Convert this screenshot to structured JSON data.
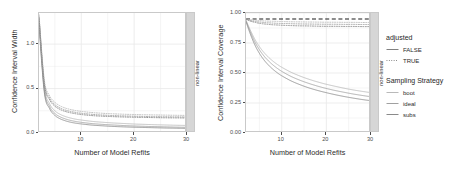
{
  "figure": {
    "background": "#ffffff",
    "panel_border_color": "#c9c9c9",
    "strip_background": "#d6d6d6",
    "grid_color": "#ebebeb"
  },
  "panels": [
    {
      "strip_label": "non-linear",
      "xlabel": "Number of Model Refits",
      "ylabel": "Confidence Interval Width",
      "x_ticks": [
        "10",
        "20",
        "30"
      ],
      "y_ticks": [
        "0.0",
        "0.5",
        "1.0"
      ]
    },
    {
      "strip_label": "non-linear",
      "xlabel": "Number of Model Refits",
      "ylabel": "Confidence Interval Coverage",
      "x_ticks": [
        "10",
        "20",
        "30"
      ],
      "y_ticks": [
        "0.00",
        "0.25",
        "0.50",
        "0.75",
        "1.00"
      ]
    }
  ],
  "legend": {
    "groups": [
      {
        "title": "adjusted",
        "items": [
          {
            "label": "FALSE",
            "linetype": "solid",
            "color": "#808080"
          },
          {
            "label": "TRUE",
            "linetype": "dotted",
            "color": "#808080"
          }
        ]
      },
      {
        "title": "Sampling Strategy",
        "items": [
          {
            "label": "boot",
            "linetype": "solid",
            "color": "#b9b9b9"
          },
          {
            "label": "ideal",
            "linetype": "solid",
            "color": "#a0a0a0"
          },
          {
            "label": "subs",
            "linetype": "solid",
            "color": "#8a8a8a"
          }
        ]
      }
    ]
  },
  "chart_data": {
    "type": "line",
    "title": "",
    "facet": "non-linear",
    "panels": [
      {
        "name": "width-panel",
        "xlabel": "Number of Model Refits",
        "ylabel": "Confidence Interval Width",
        "xlim": [
          2,
          30
        ],
        "ylim": [
          0.0,
          1.35
        ],
        "x_ticks": [
          10,
          20,
          30
        ],
        "y_ticks": [
          0.0,
          0.5,
          1.0
        ],
        "grid": true,
        "x": [
          2,
          3,
          4,
          5,
          6,
          7,
          8,
          9,
          10,
          12,
          14,
          16,
          18,
          20,
          22,
          24,
          26,
          28,
          30
        ],
        "series": [
          {
            "name": "boot, adjusted=FALSE",
            "sampling": "boot",
            "adjusted": "FALSE",
            "linetype": "solid",
            "color": "#b9b9b9",
            "values": [
              1.3,
              0.52,
              0.33,
              0.25,
              0.21,
              0.185,
              0.168,
              0.155,
              0.146,
              0.131,
              0.121,
              0.113,
              0.107,
              0.101,
              0.097,
              0.093,
              0.09,
              0.087,
              0.085
            ]
          },
          {
            "name": "ideal, adjusted=FALSE",
            "sampling": "ideal",
            "adjusted": "FALSE",
            "linetype": "solid",
            "color": "#a0a0a0",
            "values": [
              1.26,
              0.49,
              0.3,
              0.22,
              0.182,
              0.158,
              0.141,
              0.129,
              0.12,
              0.106,
              0.097,
              0.09,
              0.084,
              0.079,
              0.075,
              0.072,
              0.069,
              0.066,
              0.064
            ]
          },
          {
            "name": "subs, adjusted=FALSE",
            "sampling": "subs",
            "adjusted": "FALSE",
            "linetype": "solid",
            "color": "#8a8a8a",
            "values": [
              1.22,
              0.46,
              0.275,
              0.198,
              0.16,
              0.137,
              0.121,
              0.11,
              0.102,
              0.089,
              0.081,
              0.074,
              0.069,
              0.065,
              0.062,
              0.059,
              0.056,
              0.054,
              0.052
            ]
          },
          {
            "name": "boot, adjusted=TRUE",
            "sampling": "boot",
            "adjusted": "TRUE",
            "linetype": "dotted",
            "color": "#b9b9b9",
            "values": [
              1.33,
              0.6,
              0.42,
              0.345,
              0.305,
              0.28,
              0.264,
              0.252,
              0.243,
              0.23,
              0.222,
              0.216,
              0.211,
              0.208,
              0.205,
              0.203,
              0.201,
              0.199,
              0.198
            ]
          },
          {
            "name": "ideal, adjusted=TRUE",
            "sampling": "ideal",
            "adjusted": "TRUE",
            "linetype": "dotted",
            "color": "#a0a0a0",
            "values": [
              1.31,
              0.57,
              0.395,
              0.32,
              0.282,
              0.258,
              0.242,
              0.231,
              0.222,
              0.21,
              0.202,
              0.196,
              0.192,
              0.189,
              0.186,
              0.184,
              0.182,
              0.181,
              0.18
            ]
          },
          {
            "name": "subs, adjusted=TRUE",
            "sampling": "subs",
            "adjusted": "TRUE",
            "linetype": "dotted",
            "color": "#8a8a8a",
            "values": [
              1.29,
              0.55,
              0.375,
              0.302,
              0.265,
              0.242,
              0.227,
              0.216,
              0.208,
              0.196,
              0.189,
              0.184,
              0.18,
              0.177,
              0.175,
              0.173,
              0.171,
              0.17,
              0.169
            ]
          }
        ]
      },
      {
        "name": "coverage-panel",
        "xlabel": "Number of Model Refits",
        "ylabel": "Confidence Interval Coverage",
        "xlim": [
          2,
          30
        ],
        "ylim": [
          0.0,
          1.0
        ],
        "x_ticks": [
          10,
          20,
          30
        ],
        "y_ticks": [
          0.0,
          0.25,
          0.5,
          0.75,
          1.0
        ],
        "grid": true,
        "reference_line": {
          "value": 0.95,
          "linetype": "dashed",
          "color": "#1a1a1a"
        },
        "x": [
          2,
          3,
          4,
          5,
          6,
          7,
          8,
          9,
          10,
          12,
          14,
          16,
          18,
          20,
          22,
          24,
          26,
          28,
          30
        ],
        "series": [
          {
            "name": "boot, adjusted=TRUE",
            "sampling": "boot",
            "adjusted": "TRUE",
            "linetype": "dotted",
            "color": "#b9b9b9",
            "values": [
              0.95,
              0.944,
              0.94,
              0.937,
              0.934,
              0.932,
              0.931,
              0.93,
              0.929,
              0.927,
              0.926,
              0.925,
              0.924,
              0.923,
              0.923,
              0.922,
              0.922,
              0.921,
              0.921
            ]
          },
          {
            "name": "ideal, adjusted=TRUE",
            "sampling": "ideal",
            "adjusted": "TRUE",
            "linetype": "dotted",
            "color": "#a0a0a0",
            "values": [
              0.948,
              0.938,
              0.93,
              0.925,
              0.921,
              0.918,
              0.916,
              0.914,
              0.913,
              0.911,
              0.909,
              0.908,
              0.907,
              0.906,
              0.906,
              0.905,
              0.905,
              0.904,
              0.904
            ]
          },
          {
            "name": "subs, adjusted=TRUE",
            "sampling": "subs",
            "adjusted": "TRUE",
            "linetype": "dotted",
            "color": "#8a8a8a",
            "values": [
              0.946,
              0.932,
              0.922,
              0.914,
              0.909,
              0.905,
              0.902,
              0.9,
              0.898,
              0.895,
              0.893,
              0.892,
              0.89,
              0.889,
              0.889,
              0.888,
              0.888,
              0.887,
              0.887
            ]
          },
          {
            "name": "boot, adjusted=FALSE",
            "sampling": "boot",
            "adjusted": "FALSE",
            "linetype": "solid",
            "color": "#b9b9b9",
            "values": [
              0.94,
              0.855,
              0.78,
              0.72,
              0.672,
              0.633,
              0.6,
              0.572,
              0.548,
              0.508,
              0.476,
              0.449,
              0.426,
              0.406,
              0.389,
              0.373,
              0.359,
              0.347,
              0.336
            ]
          },
          {
            "name": "ideal, adjusted=FALSE",
            "sampling": "ideal",
            "adjusted": "FALSE",
            "linetype": "solid",
            "color": "#a0a0a0",
            "values": [
              0.935,
              0.84,
              0.758,
              0.694,
              0.643,
              0.602,
              0.568,
              0.539,
              0.514,
              0.473,
              0.441,
              0.414,
              0.391,
              0.371,
              0.354,
              0.339,
              0.325,
              0.313,
              0.302
            ]
          },
          {
            "name": "subs, adjusted=FALSE",
            "sampling": "subs",
            "adjusted": "FALSE",
            "linetype": "solid",
            "color": "#8a8a8a",
            "values": [
              0.928,
              0.822,
              0.733,
              0.664,
              0.61,
              0.567,
              0.532,
              0.502,
              0.477,
              0.436,
              0.404,
              0.377,
              0.355,
              0.336,
              0.319,
              0.304,
              0.291,
              0.279,
              0.269
            ]
          }
        ]
      }
    ]
  }
}
